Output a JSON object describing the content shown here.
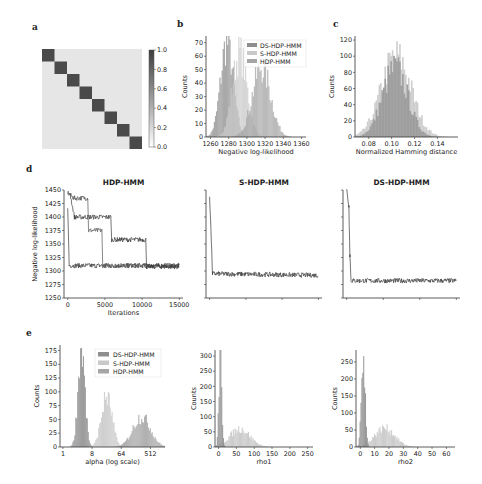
{
  "colors": {
    "ds": "#8f8f8f",
    "s": "#c9c9c9",
    "hdp": "#a6a6a6",
    "line_dark": "#3a3a3a",
    "line_mid": "#555555",
    "heat_low": "#e6e6e6",
    "heat_high": "#4a4a4a",
    "axis": "#333333"
  },
  "panels": {
    "a": {
      "letter": "a"
    },
    "b": {
      "letter": "b"
    },
    "c": {
      "letter": "c"
    },
    "d": {
      "letter": "d"
    },
    "e": {
      "letter": "e"
    }
  },
  "chart_data": [
    {
      "id": "a",
      "type": "heatmap",
      "title": "",
      "description": "8x8 block-diagonal matrix; diagonal ~0.85, off-diagonal ~0.05",
      "size": 8,
      "diagonal_value": 0.85,
      "offdiag_value": 0.05,
      "colorbar": {
        "ticks": [
          "0.0",
          "0.2",
          "0.4",
          "0.6",
          "0.8",
          "1.0"
        ],
        "range": [
          0,
          1
        ]
      }
    },
    {
      "id": "b",
      "type": "bar",
      "subtype": "histogram",
      "xlabel": "Negative log-likelihood",
      "ylabel": "Counts",
      "xticks": [
        "1260",
        "1280",
        "1300",
        "1320",
        "1340",
        "1360"
      ],
      "xlim": [
        1255,
        1365
      ],
      "yticks": [
        "0",
        "10",
        "20",
        "30",
        "40",
        "50",
        "60",
        "70"
      ],
      "ylim": [
        0,
        75
      ],
      "legend": [
        "DS-HDP-HMM",
        "S-HDP-HMM",
        "HDP-HMM"
      ],
      "legend_position": "upper right",
      "series": [
        {
          "name": "DS-HDP-HMM",
          "mean": 1278,
          "sd": 7,
          "peak": 70
        },
        {
          "name": "S-HDP-HMM",
          "mean": 1292,
          "sd": 8,
          "peak": 62
        },
        {
          "name": "HDP-HMM",
          "mean": 1316,
          "sd": 10,
          "peak": 52
        }
      ]
    },
    {
      "id": "c",
      "type": "bar",
      "subtype": "histogram",
      "xlabel": "Normalized Hamming distance",
      "ylabel": "Counts",
      "xticks": [
        "0.08",
        "0.10",
        "0.12",
        "0.14"
      ],
      "xlim": [
        0.068,
        0.158
      ],
      "yticks": [
        "0",
        "20",
        "40",
        "60",
        "80",
        "100",
        "120"
      ],
      "ylim": [
        0,
        125
      ],
      "series": [
        {
          "name": "dark",
          "mean": 0.103,
          "sd": 0.011,
          "peak": 85
        },
        {
          "name": "light",
          "mean": 0.104,
          "sd": 0.013,
          "peak": 100
        }
      ]
    },
    {
      "id": "d1",
      "type": "line",
      "title": "HDP-HMM",
      "xlabel": "Iterations",
      "ylabel": "Negative log-likelihood",
      "xticks": [
        "0",
        "5000",
        "10000",
        "15000"
      ],
      "xlim": [
        -500,
        15500
      ],
      "yticks": [
        "1250",
        "1275",
        "1300",
        "1325",
        "1350",
        "1375",
        "1400",
        "1425",
        "1450"
      ],
      "ylim": [
        1250,
        1450
      ],
      "series": [
        {
          "name": "run1",
          "segments": [
            [
              0,
              1420
            ],
            [
              200,
              1310
            ],
            [
              15000,
              1310
            ]
          ]
        },
        {
          "name": "run2",
          "segments": [
            [
              0,
              1445
            ],
            [
              800,
              1435
            ],
            [
              2700,
              1435
            ],
            [
              2800,
              1375
            ],
            [
              4600,
              1375
            ],
            [
              4700,
              1310
            ],
            [
              15000,
              1310
            ]
          ]
        },
        {
          "name": "run3",
          "segments": [
            [
              300,
              1445
            ],
            [
              900,
              1400
            ],
            [
              5800,
              1400
            ],
            [
              5900,
              1358
            ],
            [
              10500,
              1358
            ],
            [
              10600,
              1308
            ],
            [
              15000,
              1308
            ]
          ]
        }
      ]
    },
    {
      "id": "d2",
      "type": "line",
      "title": "S-HDP-HMM",
      "xlim": [
        -500,
        15500
      ],
      "ylim": [
        1250,
        1450
      ],
      "series": [
        {
          "name": "run",
          "segments": [
            [
              0,
              1440
            ],
            [
              400,
              1295
            ],
            [
              15000,
              1292
            ]
          ]
        }
      ]
    },
    {
      "id": "d3",
      "type": "line",
      "title": "DS-HDP-HMM",
      "xlim": [
        -500,
        15500
      ],
      "ylim": [
        1250,
        1450
      ],
      "series": [
        {
          "name": "run",
          "segments": [
            [
              0,
              1450
            ],
            [
              300,
              1420
            ],
            [
              450,
              1330
            ],
            [
              600,
              1282
            ],
            [
              15000,
              1282
            ]
          ]
        }
      ]
    },
    {
      "id": "e1",
      "type": "bar",
      "subtype": "histogram",
      "xlabel": "alpha (log scale)",
      "ylabel": "Counts",
      "xticks": [
        "1",
        "8",
        "64",
        "512"
      ],
      "xlim_log2": [
        -0.3,
        10.5
      ],
      "yticks": [
        "0",
        "25",
        "50",
        "75",
        "100",
        "125",
        "150",
        "175"
      ],
      "ylim": [
        0,
        185
      ],
      "legend": [
        "DS-HDP-HMM",
        "S-HDP-HMM",
        "HDP-HMM"
      ],
      "legend_position": "upper right",
      "series": [
        {
          "name": "DS-HDP-HMM",
          "mean_log2": 1.9,
          "sd": 0.35,
          "peak": 178
        },
        {
          "name": "S-HDP-HMM",
          "mean_log2": 4.5,
          "sd": 0.55,
          "peak": 90
        },
        {
          "name": "HDP-HMM",
          "mean_log2": 8.1,
          "sd": 0.9,
          "peak": 55
        }
      ]
    },
    {
      "id": "e2",
      "type": "bar",
      "subtype": "histogram",
      "xlabel": "rho1",
      "ylabel": "Counts",
      "xticks": [
        "0",
        "50",
        "100",
        "150",
        "200",
        "250"
      ],
      "xlim": [
        -10,
        265
      ],
      "yticks": [
        "0",
        "50",
        "100",
        "150",
        "200",
        "250",
        "300"
      ],
      "ylim": [
        0,
        320
      ],
      "series": [
        {
          "name": "DS-HDP-HMM",
          "mean": 5,
          "sd": 4,
          "peak": 310
        },
        {
          "name": "S-HDP-HMM",
          "mean": 60,
          "sd": 28,
          "peak": 60
        }
      ]
    },
    {
      "id": "e3",
      "type": "bar",
      "subtype": "histogram",
      "xlabel": "rho2",
      "ylabel": "Counts",
      "xticks": [
        "0",
        "10",
        "20",
        "30",
        "40",
        "50",
        "60"
      ],
      "xlim": [
        -3,
        66
      ],
      "yticks": [
        "0",
        "50",
        "100",
        "150",
        "200",
        "250"
      ],
      "ylim": [
        0,
        285
      ],
      "series": [
        {
          "name": "DS-HDP-HMM",
          "mean": 2,
          "sd": 1.3,
          "peak": 270
        },
        {
          "name": "S-HDP-HMM",
          "mean": 17,
          "sd": 7,
          "peak": 55
        }
      ]
    }
  ]
}
